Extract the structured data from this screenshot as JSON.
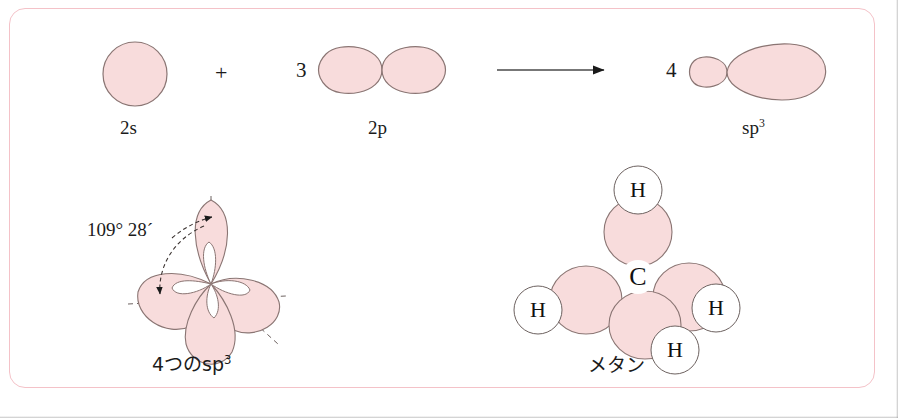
{
  "figure": {
    "title_alt": "sp3 hybridization of carbon forming methane",
    "frame_color": "#f4c2c8",
    "orbital_fill": "#f8dcdc",
    "orbital_stroke": "#8a7573",
    "background": "#ffffff"
  },
  "equation": {
    "term_2s": {
      "label": "2s",
      "coefficient": ""
    },
    "plus_sign": "+",
    "term_2p": {
      "label": "2p",
      "coefficient": "3"
    },
    "arrow": "yields-arrow",
    "term_sp3": {
      "label_base": "sp",
      "label_sup": "3",
      "coefficient": "4"
    }
  },
  "hybrid_cluster": {
    "angle_label": "109° 28´",
    "caption_base": "4つのsp",
    "caption_sup": "3"
  },
  "methane": {
    "caption": "メタン",
    "center_atom": "C",
    "hydrogens": [
      "H",
      "H",
      "H",
      "H"
    ]
  }
}
